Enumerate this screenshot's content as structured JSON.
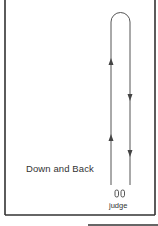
{
  "diagram": {
    "title": "Down and Back",
    "judge_label": "judge",
    "colors": {
      "border": "#333333",
      "path": "#555555",
      "text": "#333333",
      "background": "#ffffff"
    },
    "path": {
      "type": "down-and-back",
      "outbound_direction": "up",
      "return_direction": "down",
      "arrows": [
        {
          "side": "left",
          "direction": "up",
          "y": 62
        },
        {
          "side": "left",
          "direction": "up",
          "y": 138
        },
        {
          "side": "right",
          "direction": "down",
          "y": 97
        },
        {
          "side": "right",
          "direction": "down",
          "y": 153
        }
      ]
    },
    "judge_icon": "footprints-icon"
  }
}
